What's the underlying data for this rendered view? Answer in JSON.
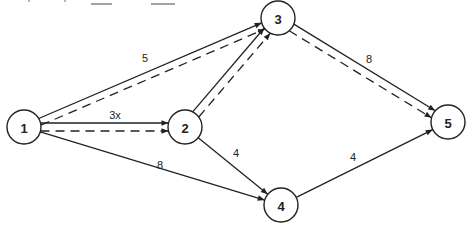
{
  "diagram": {
    "type": "directed-network",
    "nodes": [
      {
        "id": "1",
        "label": "1"
      },
      {
        "id": "2",
        "label": "2"
      },
      {
        "id": "3",
        "label": "3"
      },
      {
        "id": "4",
        "label": "4"
      },
      {
        "id": "5",
        "label": "5"
      }
    ],
    "edges": [
      {
        "from": "1",
        "to": "3",
        "label": "5",
        "style": "solid"
      },
      {
        "from": "1",
        "to": "3",
        "label": "",
        "style": "dashed"
      },
      {
        "from": "1",
        "to": "2",
        "label": "3x",
        "style": "solid"
      },
      {
        "from": "1",
        "to": "2",
        "label": "",
        "style": "dashed"
      },
      {
        "from": "1",
        "to": "4",
        "label": "8",
        "style": "solid"
      },
      {
        "from": "2",
        "to": "3",
        "label": "2x",
        "style": "solid"
      },
      {
        "from": "2",
        "to": "3",
        "label": "",
        "style": "dashed"
      },
      {
        "from": "2",
        "to": "4",
        "label": "4",
        "style": "solid"
      },
      {
        "from": "3",
        "to": "5",
        "label": "8",
        "style": "solid"
      },
      {
        "from": "3",
        "to": "5",
        "label": "",
        "style": "dashed"
      },
      {
        "from": "4",
        "to": "5",
        "label": "4",
        "style": "solid"
      }
    ],
    "colors": {
      "stroke": "#222222",
      "background": "#ffffff"
    }
  }
}
